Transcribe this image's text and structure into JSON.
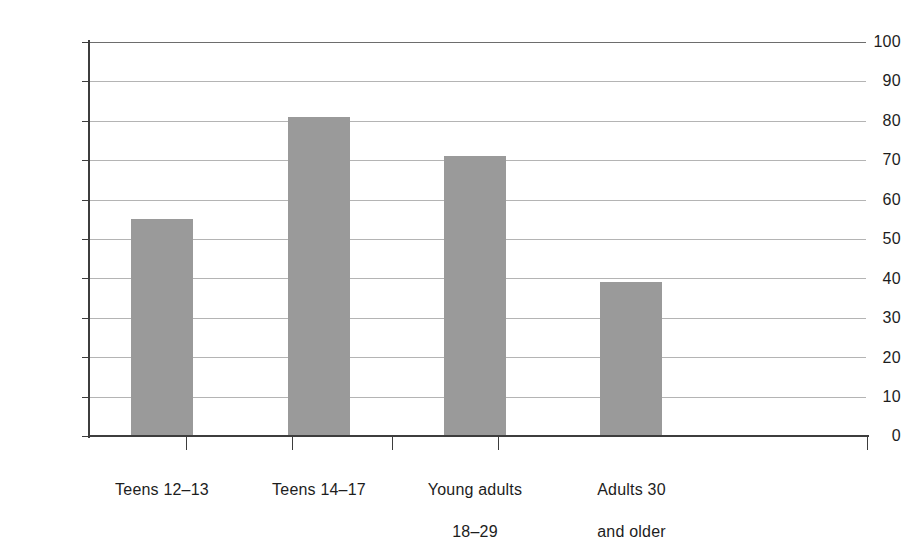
{
  "chart_data": {
    "type": "bar",
    "title": "",
    "subtitle": "",
    "xlabel": "",
    "ylabel": "",
    "categories": [
      "Teens 12–13",
      "Teens 14–17",
      "Young adults\n18–29",
      "Adults 30\nand older"
    ],
    "values": [
      55,
      81,
      71,
      39
    ],
    "ylim": [
      0,
      100
    ],
    "yticks": [
      0,
      10,
      20,
      30,
      40,
      50,
      60,
      70,
      80,
      90,
      100
    ],
    "ytick_labels": [
      "0",
      "10",
      "20",
      "30",
      "40",
      "50",
      "60",
      "70",
      "80",
      "90",
      "100"
    ],
    "grid": true,
    "grid_axis": "y",
    "legend": null,
    "legend_position": "none",
    "annotations": [],
    "bar_color": "#9a9a9a",
    "gridline_color": "#b4b4b4",
    "axis_color": "#3d3d3d",
    "background_color": "#ffffff"
  },
  "axes": {
    "y_tick_labels": [
      "100",
      "90",
      "80",
      "70",
      "60",
      "50",
      "40",
      "30",
      "20",
      "10",
      "0"
    ],
    "x_category_labels": [
      {
        "line1": "Teens 12–13",
        "line2": ""
      },
      {
        "line1": "Teens 14–17",
        "line2": ""
      },
      {
        "line1": "Young adults",
        "line2": "18–29"
      },
      {
        "line1": "Adults 30",
        "line2": "and older"
      }
    ]
  }
}
